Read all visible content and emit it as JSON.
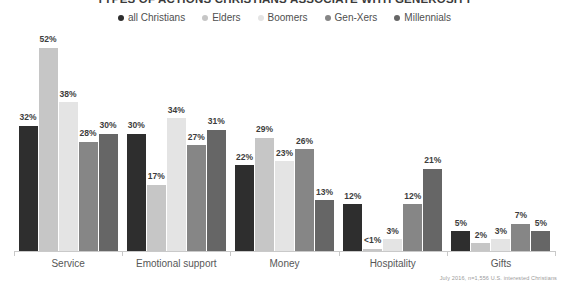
{
  "chart_data": {
    "type": "bar",
    "title": "TYPES OF ACTIONS CHRISTIANS ASSOCIATE WITH GENEROSITY",
    "xlabel": "",
    "ylabel": "",
    "ylim": [
      0,
      55
    ],
    "grid": false,
    "legend_position": "top-center",
    "categories": [
      "Service",
      "Emotional support",
      "Money",
      "Hospitality",
      "Gifts"
    ],
    "series": [
      {
        "name": "all Christians",
        "color": "#2e2e2e",
        "values": [
          32,
          30,
          22,
          12,
          5
        ],
        "labels": [
          "32%",
          "30%",
          "22%",
          "12%",
          "5%"
        ]
      },
      {
        "name": "Elders",
        "color": "#c6c6c6",
        "values": [
          52,
          17,
          29,
          0.6,
          2
        ],
        "labels": [
          "52%",
          "17%",
          "29%",
          "<1%",
          "2%"
        ]
      },
      {
        "name": "Boomers",
        "color": "#e4e4e4",
        "values": [
          38,
          34,
          23,
          3,
          3
        ],
        "labels": [
          "38%",
          "34%",
          "23%",
          "3%",
          "3%"
        ]
      },
      {
        "name": "Gen-Xers",
        "color": "#868686",
        "values": [
          28,
          27,
          26,
          12,
          7
        ],
        "labels": [
          "28%",
          "27%",
          "26%",
          "12%",
          "7%"
        ]
      },
      {
        "name": "Millennials",
        "color": "#666666",
        "values": [
          30,
          31,
          13,
          21,
          5
        ],
        "labels": [
          "30%",
          "31%",
          "13%",
          "21%",
          "5%"
        ]
      }
    ]
  },
  "footnote": "July 2016, n=1,556 U.S. interested Christians"
}
